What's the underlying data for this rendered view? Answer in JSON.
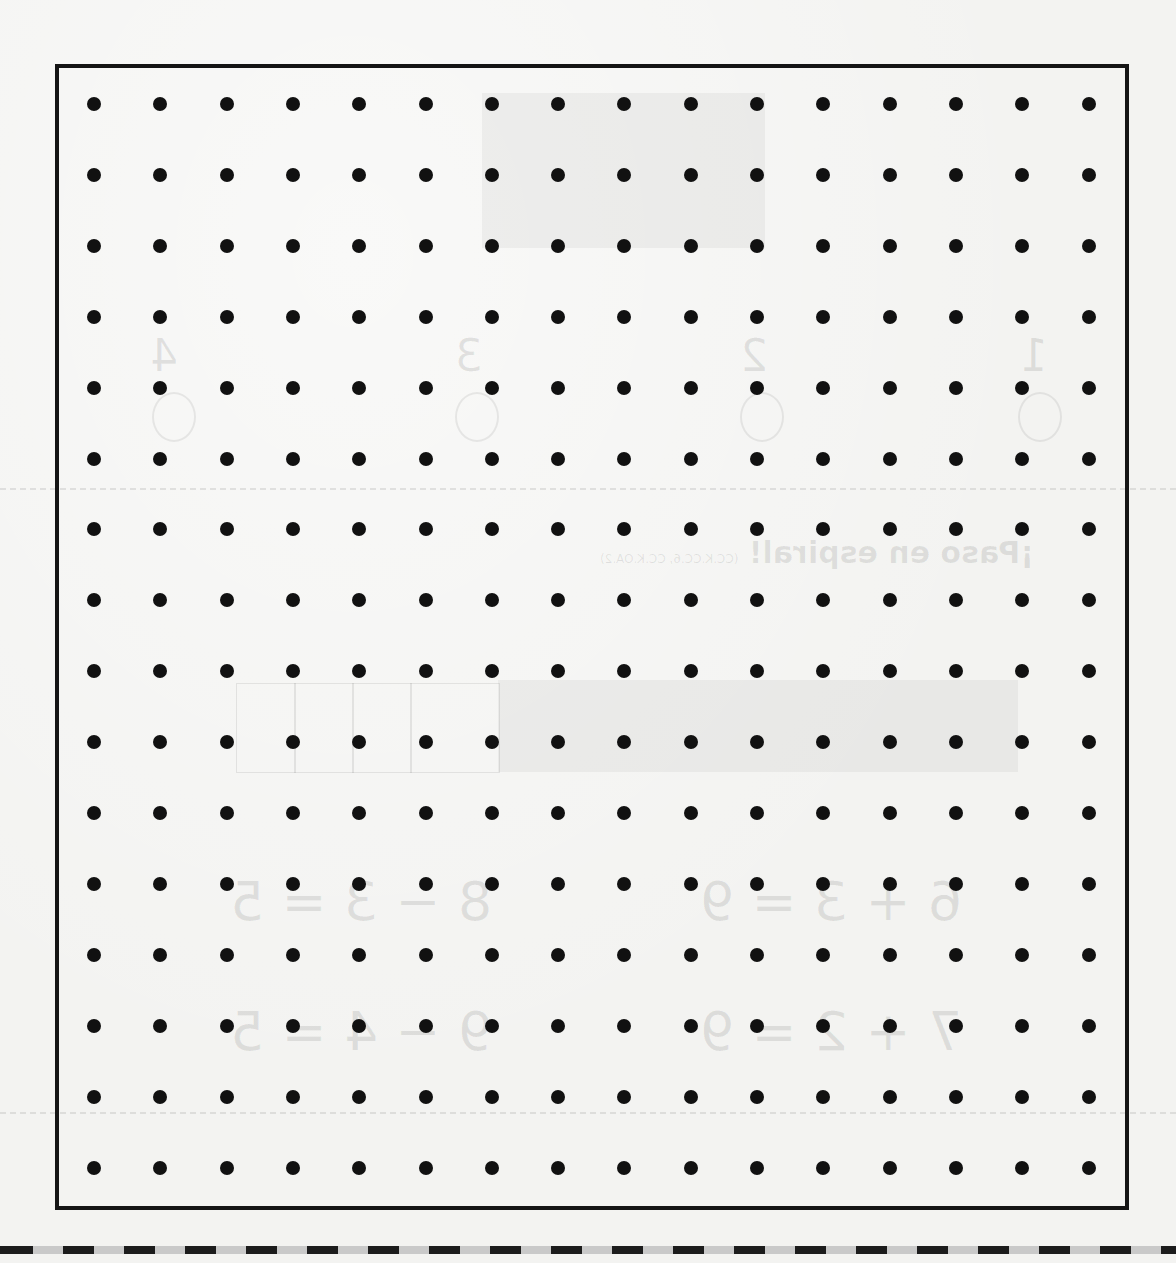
{
  "page": {
    "type": "dot-paper worksheet",
    "background_color": "#f3f3f1",
    "ink_color": "#111111"
  },
  "dot_grid": {
    "columns": 16,
    "rows": 16,
    "dot_diameter_px": 14,
    "first_dot_x": 94,
    "first_dot_y": 104,
    "col_spacing_px": 66.3,
    "row_spacing_px": 70.9
  },
  "frame": {
    "left": 55,
    "top": 64,
    "right": 1129,
    "bottom": 1210,
    "border_width_px": 4
  },
  "cut_line": {
    "style": "dashed",
    "dash_color": "#1c1c1c",
    "gap_color": "#c9c9c9",
    "y": 1246
  },
  "bleed_through": {
    "note": "faint mirrored reverse-side content",
    "heading": "¡Paso en espiral!",
    "standards": "(CC.K.CC.6, CC.K.OA.2)",
    "numbers": [
      "4",
      "3",
      "2",
      "1"
    ],
    "equations": [
      "6 + 3 = 9",
      "8 − 3 = 5",
      "7 + 2 = 9",
      "9 − 4 = 5"
    ]
  }
}
